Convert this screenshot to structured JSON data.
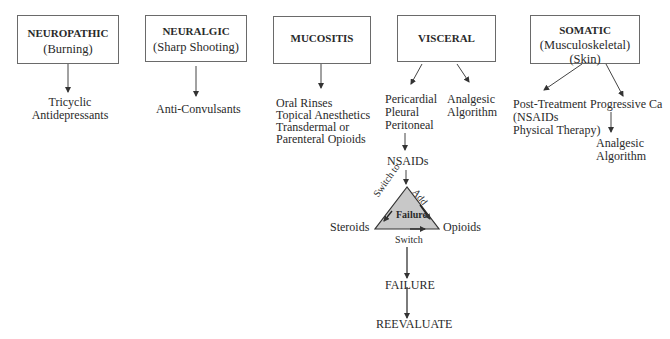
{
  "categories": [
    {
      "id": "neuropathic",
      "title": "NEUROPATHIC",
      "subtitle": [
        "(Burning)"
      ],
      "treatments": [
        {
          "lines": [
            "Tricyclic",
            "Antidepressants"
          ]
        }
      ]
    },
    {
      "id": "neuralgic",
      "title": "NEURALGIC",
      "subtitle": [
        "(Sharp Shooting)"
      ],
      "treatments": [
        {
          "lines": [
            "Anti-Convulsants"
          ]
        }
      ]
    },
    {
      "id": "mucositis",
      "title": "MUCOSITIS",
      "subtitle": [],
      "treatments": [
        {
          "lines": [
            "Oral Rinses",
            "Topical Anesthetics",
            "Transdermal or",
            "Parenteral Opioids"
          ]
        }
      ]
    },
    {
      "id": "visceral",
      "title": "VISCERAL",
      "subtitle": [],
      "treatments": [
        {
          "lines": [
            "Pericardial",
            "Pleural",
            "Peritoneal"
          ]
        },
        {
          "lines": [
            "Analgesic",
            "Algorithm"
          ]
        }
      ]
    },
    {
      "id": "somatic",
      "title": "SOMATIC",
      "subtitle": [
        "(Musculoskeletal)",
        "(Skin)"
      ],
      "treatments": [
        {
          "lines": [
            "Post-Treatment",
            "(NSAIDs",
            "Physical Therapy)"
          ]
        },
        {
          "lines": [
            "Progressive Ca"
          ]
        }
      ]
    }
  ],
  "somatic_followup": {
    "lines": [
      "Analgesic",
      "Algorithm"
    ]
  },
  "visceral_pathway": {
    "nsaids": "NSAIDs",
    "triangle": {
      "left": "Steroids",
      "right": "Opioids",
      "center": "Failure",
      "edge_left": "Switch to",
      "edge_right": "Add",
      "edge_bottom": "Switch",
      "fill": "#c8c8c8"
    },
    "failure": "FAILURE",
    "reevaluate": "REEVALUATE"
  }
}
